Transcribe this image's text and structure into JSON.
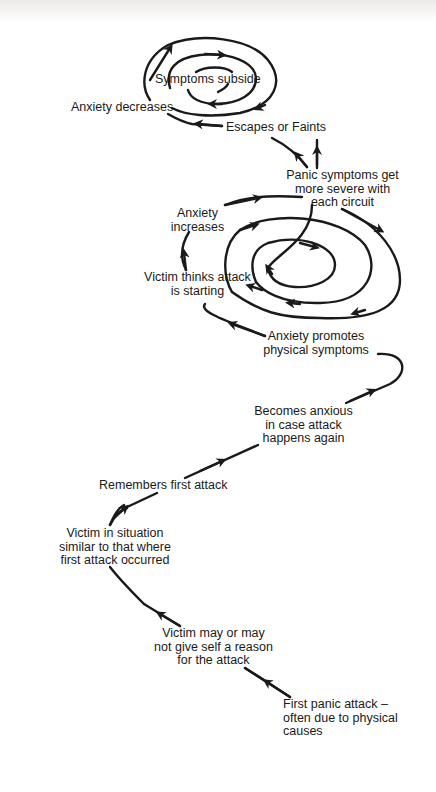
{
  "diagram": {
    "type": "flow-spiral",
    "colors": {
      "ink": "#1a1a1a",
      "background": "#ffffff"
    },
    "nodes": [
      {
        "id": "first_attack",
        "lines": [
          "First panic attack –",
          "often due to physical",
          "causes"
        ]
      },
      {
        "id": "reason",
        "lines": [
          "Victim may or may",
          "not give self a reason",
          "for the attack"
        ]
      },
      {
        "id": "situation",
        "lines": [
          "Victim in situation",
          "similar to that where",
          "first attack occurred"
        ]
      },
      {
        "id": "remembers",
        "lines": [
          "Remembers first attack"
        ]
      },
      {
        "id": "anxious",
        "lines": [
          "Becomes anxious",
          "in case attack",
          "happens again"
        ]
      },
      {
        "id": "promotes",
        "lines": [
          "Anxiety promotes",
          "physical symptoms"
        ]
      },
      {
        "id": "thinks",
        "lines": [
          "Victim thinks attack",
          "is starting"
        ]
      },
      {
        "id": "increases",
        "lines": [
          "Anxiety",
          "increases"
        ]
      },
      {
        "id": "severe",
        "lines": [
          "Panic symptoms get",
          "more severe with",
          "each circuit"
        ]
      },
      {
        "id": "escapes",
        "lines": [
          "Escapes  or  Faints"
        ]
      },
      {
        "id": "decreases",
        "lines": [
          "Anxiety decreases"
        ]
      },
      {
        "id": "subside",
        "lines": [
          "Symptoms subside"
        ]
      }
    ]
  }
}
